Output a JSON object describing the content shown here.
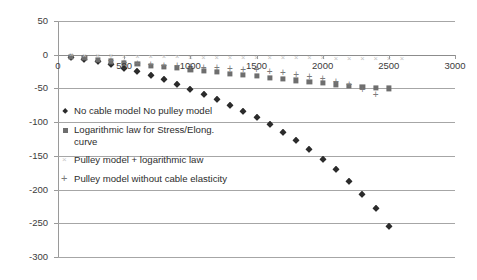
{
  "chart_data": {
    "type": "scatter",
    "title": "",
    "xlabel": "",
    "ylabel": "",
    "xlim": [
      0,
      3000
    ],
    "ylim": [
      -300,
      50
    ],
    "x_ticks": [
      0,
      500,
      1000,
      1500,
      2000,
      2500,
      3000
    ],
    "y_ticks": [
      50,
      0,
      -50,
      -100,
      -150,
      -200,
      -250,
      -300
    ],
    "grid": true,
    "legend_position": "inside-left",
    "colors": {
      "series_1": "#2b2b2b",
      "series_2": "#6e6e6e",
      "series_3": "#c3c3c3",
      "series_4": "#7a7a7a",
      "gridline": "#a6a6a6",
      "axis": "#8c8c8c",
      "text": "#3b3b3b",
      "background": "#ffffff"
    },
    "series": [
      {
        "name": "No cable model No pulley model",
        "marker": "diamond",
        "color": "#2b2b2b",
        "x": [
          100,
          200,
          300,
          400,
          500,
          600,
          700,
          800,
          900,
          1000,
          1100,
          1200,
          1300,
          1400,
          1500,
          1600,
          1700,
          1800,
          1900,
          2000,
          2100,
          2200,
          2300,
          2400,
          2500
        ],
        "y": [
          -3,
          -6,
          -10,
          -14,
          -19,
          -24,
          -30,
          -36,
          -44,
          -51,
          -58,
          -66,
          -74,
          -83,
          -93,
          -103,
          -114,
          -126,
          -140,
          -154,
          -170,
          -187,
          -206,
          -228,
          -254
        ]
      },
      {
        "name": "Logarithmic law for Stress/Elong. curve",
        "marker": "square",
        "color": "#6e6e6e",
        "x": [
          100,
          200,
          300,
          400,
          500,
          600,
          700,
          800,
          900,
          1000,
          1100,
          1200,
          1300,
          1400,
          1500,
          1600,
          1700,
          1800,
          1900,
          2000,
          2100,
          2200,
          2300,
          2400,
          2500
        ],
        "y": [
          -3,
          -5,
          -8,
          -10,
          -12,
          -14,
          -16,
          -18,
          -20,
          -22,
          -24,
          -26,
          -28,
          -30,
          -32,
          -34,
          -36,
          -38,
          -40,
          -42,
          -44,
          -46,
          -48,
          -49,
          -50
        ]
      },
      {
        "name": "Pulley model + logarithmic law",
        "marker": "cross",
        "color": "#c3c3c3",
        "x": [
          100,
          200,
          300,
          400,
          500,
          600,
          700,
          800,
          900,
          1000,
          1100,
          1200,
          1300,
          1400,
          1500,
          1600,
          1700,
          1800,
          1900,
          2000,
          2100,
          2200,
          2300,
          2400,
          2500,
          2600
        ],
        "y": [
          -1,
          -1.5,
          -2,
          -2.5,
          -3,
          -3.2,
          -3.5,
          -3.8,
          -4,
          -4.2,
          -4.4,
          -4.6,
          -4.8,
          -5,
          -5.1,
          -5.2,
          -5.3,
          -5.4,
          -5.5,
          -5.6,
          -5.7,
          -5.8,
          -5.9,
          -6,
          -6.1,
          -6.2
        ]
      },
      {
        "name": "Pulley model without cable elasticity",
        "marker": "plus",
        "color": "#7a7a7a",
        "x": [
          400,
          500,
          600,
          700,
          800,
          900,
          1000,
          1100,
          1200,
          1300,
          1400,
          1500,
          1600,
          1700,
          1800,
          1900,
          2000,
          2100,
          2200,
          2300,
          2400
        ],
        "y": [
          -10,
          -12,
          -14,
          -15,
          -16,
          -17,
          -18,
          -19,
          -20,
          -21,
          -22,
          -23,
          -25,
          -27,
          -30,
          -33,
          -36,
          -40,
          -45,
          -52,
          -60
        ]
      }
    ]
  },
  "axes": {
    "y_tick_labels": [
      "50",
      "0",
      "-50",
      "-100",
      "-150",
      "-200",
      "-250",
      "-300"
    ],
    "x_tick_labels": [
      "0",
      "500",
      "1000",
      "1500",
      "2000",
      "2500",
      "3000"
    ]
  },
  "legend": {
    "items": [
      {
        "label": "No cable model No pulley model",
        "marker": "diamond"
      },
      {
        "label": "Logarithmic law for Stress/Elong.\ncurve",
        "marker": "square"
      },
      {
        "label": "Pulley model + logarithmic law",
        "marker": "cross"
      },
      {
        "label": "Pulley model without cable elasticity",
        "marker": "plus"
      }
    ]
  }
}
